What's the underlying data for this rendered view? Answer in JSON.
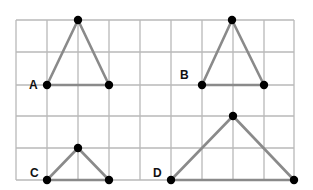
{
  "diagram": {
    "grid": {
      "columns": 9,
      "rows": 5,
      "x_lines": [
        16,
        47,
        78,
        109,
        140,
        171,
        202,
        233,
        264,
        294
      ],
      "y_lines": [
        20,
        52,
        85,
        116,
        148,
        180
      ],
      "line_color": "#b8b8b8"
    },
    "colors": {
      "edge": "#8a8a8a",
      "vertex": "#000000"
    },
    "triangles": [
      {
        "label": "A",
        "label_pos": [
          29,
          89
        ],
        "top": [
          78,
          20
        ],
        "base_left": [
          47,
          85
        ],
        "base_right": [
          109,
          85
        ]
      },
      {
        "label": "B",
        "label_pos": [
          180,
          79
        ],
        "top": [
          232,
          20
        ],
        "base_left": [
          202,
          85
        ],
        "base_right": [
          264,
          85
        ]
      },
      {
        "label": "C",
        "label_pos": [
          30,
          177
        ],
        "top": [
          78,
          148
        ],
        "base_left": [
          47,
          180
        ],
        "base_right": [
          109,
          180
        ]
      },
      {
        "label": "D",
        "label_pos": [
          153,
          177
        ],
        "top": [
          233,
          116
        ],
        "base_left": [
          171,
          180
        ],
        "base_right": [
          294,
          180
        ]
      }
    ]
  }
}
